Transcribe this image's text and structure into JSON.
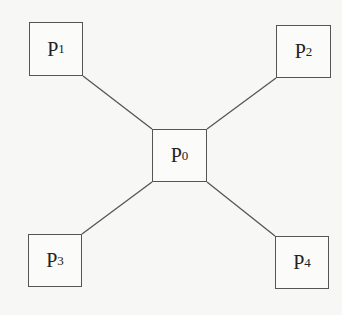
{
  "diagram": {
    "type": "star-topology",
    "line_color": "#555555",
    "background": "#f7f7f5",
    "nodes": [
      {
        "id": "P0",
        "base": "P",
        "sub": "0",
        "role": "center",
        "x": 152,
        "y": 129,
        "w": 55,
        "h": 53
      },
      {
        "id": "P1",
        "base": "P",
        "sub": "1",
        "role": "top-left",
        "x": 29,
        "y": 22,
        "w": 54,
        "h": 54
      },
      {
        "id": "P2",
        "base": "P",
        "sub": "2",
        "role": "top-right",
        "x": 276,
        "y": 25,
        "w": 55,
        "h": 53
      },
      {
        "id": "P3",
        "base": "P",
        "sub": "3",
        "role": "bottom-left",
        "x": 28,
        "y": 234,
        "w": 54,
        "h": 53
      },
      {
        "id": "P4",
        "base": "P",
        "sub": "4",
        "role": "bottom-right",
        "x": 275,
        "y": 236,
        "w": 54,
        "h": 53
      }
    ],
    "edges": [
      {
        "from": "P1",
        "to": "P0",
        "x1": 83,
        "y1": 76,
        "x2": 152,
        "y2": 129
      },
      {
        "from": "P2",
        "to": "P0",
        "x1": 276,
        "y1": 78,
        "x2": 207,
        "y2": 129
      },
      {
        "from": "P3",
        "to": "P0",
        "x1": 82,
        "y1": 234,
        "x2": 152,
        "y2": 182
      },
      {
        "from": "P4",
        "to": "P0",
        "x1": 275,
        "y1": 236,
        "x2": 207,
        "y2": 182
      }
    ]
  }
}
